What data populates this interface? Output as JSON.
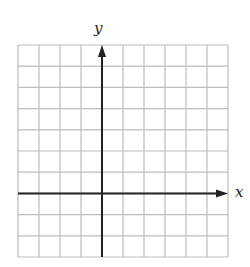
{
  "diagram": {
    "type": "coordinate-grid",
    "x_axis_label": "x",
    "y_axis_label": "y",
    "grid": {
      "columns": 10,
      "rows": 10,
      "x_min": -4,
      "x_max": 6,
      "y_min": -3,
      "y_max": 7
    },
    "colors": {
      "grid_line": "#bdbdbd",
      "axis": "#222222",
      "background": "#ffffff"
    }
  }
}
